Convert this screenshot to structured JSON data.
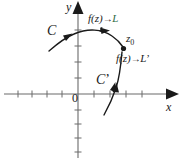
{
  "figure": {
    "name": "complex-limit-along-two-paths",
    "axes": {
      "x_label": "x",
      "y_label": "y",
      "origin_label": "0",
      "x_tick_count_negative": 5,
      "x_tick_count_positive": 4,
      "y_tick_count_positive": 4,
      "y_tick_count_negative": 5,
      "axis_color": "#6b6b6b"
    },
    "point": {
      "label_text": "z",
      "label_sub": "0",
      "marker": "filled-dot"
    },
    "curves": [
      {
        "id": "C",
        "label": "C",
        "direction_arrow": "toward-z0",
        "limit_label_prefix": "f(z)",
        "limit_arrow": "→",
        "limit_value": "L",
        "limit_color": "#2f6b44"
      },
      {
        "id": "Cprime",
        "label": "C",
        "label_prime": "’",
        "direction_arrow": "toward-z0",
        "limit_label_prefix": "f(z)",
        "limit_arrow": "→",
        "limit_value": "L",
        "limit_value_prime": "’",
        "limit_color": "#1a1a1a"
      }
    ],
    "colors": {
      "curve": "#1a1a1a",
      "axis": "#6b6b6b",
      "text": "#1a1a1a",
      "background": "#ffffff"
    }
  }
}
